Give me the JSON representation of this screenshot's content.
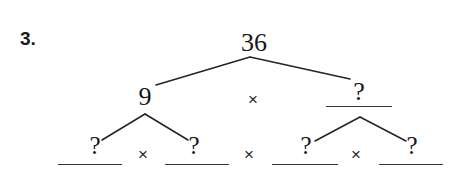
{
  "problem": {
    "number_label": "3.",
    "root_value": "36"
  },
  "tree": {
    "level1": {
      "left_label": "9",
      "operator": "×",
      "right_label": "?"
    },
    "level2": {
      "factors": [
        "?",
        "?",
        "?",
        "?"
      ],
      "operators": [
        "×",
        "×",
        "×"
      ]
    }
  },
  "colors": {
    "ink": "#161616",
    "line": "#23232a",
    "rule": "#35353a",
    "background": "#ffffff"
  }
}
